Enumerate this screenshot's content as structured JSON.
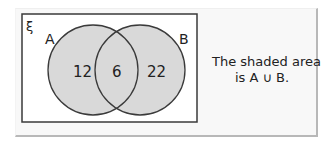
{
  "diagram": {
    "universal_symbol": "ξ",
    "sets": [
      {
        "label": "A",
        "only_value": "12"
      },
      {
        "label": "B",
        "only_value": "22"
      }
    ],
    "intersection_value": "6",
    "caption": {
      "line1": "The shaded area",
      "line2": "is A ∪ B."
    },
    "colors": {
      "shade": "#d9d9d9",
      "stroke": "#3a3a3a",
      "panel_bg": "#f8f8f8",
      "panel_border": "#b8b8b8"
    }
  }
}
